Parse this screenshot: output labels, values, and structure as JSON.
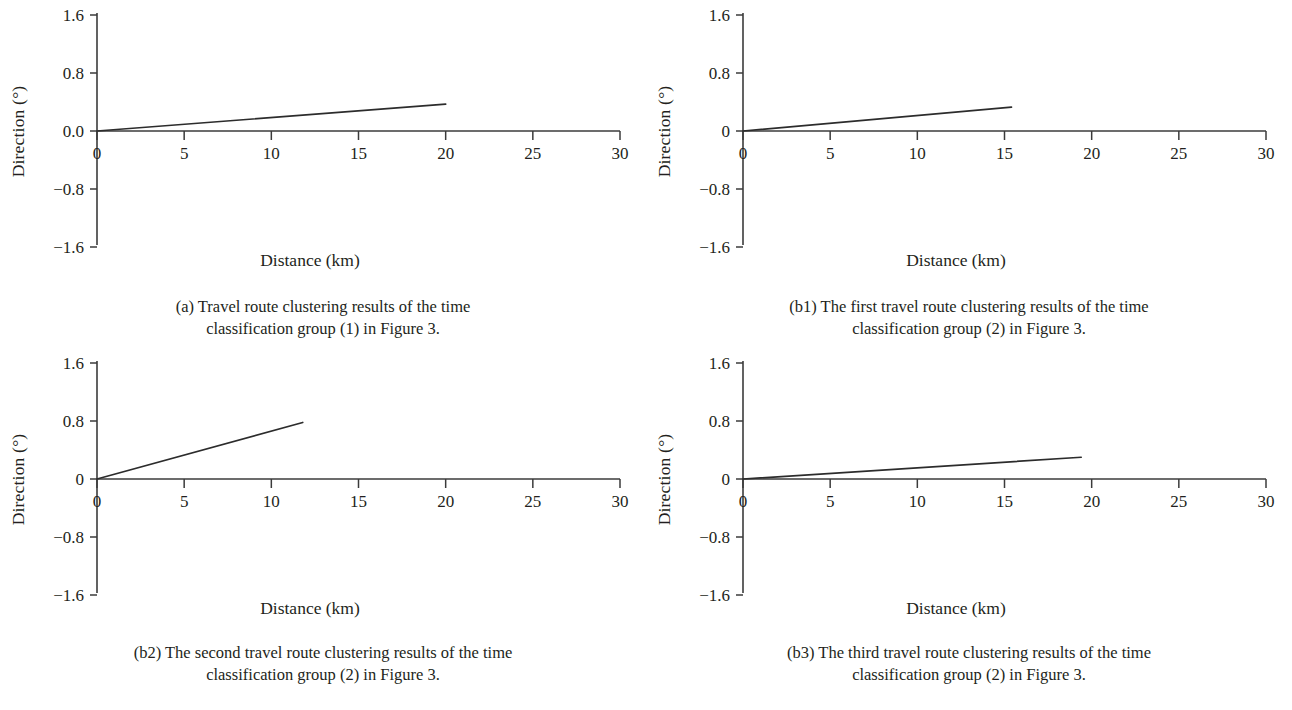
{
  "figure": {
    "background_color": "#ffffff",
    "line_color": "#2c2c2c",
    "axis_color": "#3b3b3b"
  },
  "panels": [
    {
      "id": "a",
      "xlabel": "Distance (km)",
      "ylabel": "Direction (°)",
      "xticks": [
        "0",
        "5",
        "10",
        "15",
        "20",
        "25",
        "30"
      ],
      "yticks": [
        "1.6",
        "0.8",
        "0.0",
        "−0.8",
        "−1.6"
      ],
      "caption_line1": "(a) Travel route clustering results of the time",
      "caption_line2": "classification group (1) in Figure 3."
    },
    {
      "id": "b1",
      "xlabel": "Distance (km)",
      "ylabel": "Direction (°)",
      "xticks": [
        "0",
        "5",
        "10",
        "15",
        "20",
        "25",
        "30"
      ],
      "yticks": [
        "1.6",
        "0.8",
        "0",
        "−0.8",
        "−1.6"
      ],
      "caption_line1": "(b1) The first travel route clustering results of the time",
      "caption_line2": "classification group (2) in Figure 3."
    },
    {
      "id": "b2",
      "xlabel": "Distance (km)",
      "ylabel": "Direction (°)",
      "xticks": [
        "0",
        "5",
        "10",
        "15",
        "20",
        "25",
        "30"
      ],
      "yticks": [
        "1.6",
        "0.8",
        "0",
        "−0.8",
        "−1.6"
      ],
      "caption_line1": "(b2) The second travel route clustering results of the time",
      "caption_line2": "classification group (2) in Figure 3."
    },
    {
      "id": "b3",
      "xlabel": "Distance (km)",
      "ylabel": "Direction (°)",
      "xticks": [
        "0",
        "5",
        "10",
        "15",
        "20",
        "25",
        "30"
      ],
      "yticks": [
        "1.6",
        "0.8",
        "0",
        "−0.8",
        "−1.6"
      ],
      "caption_line1": "(b3) The third travel route clustering results of the time",
      "caption_line2": "classification group (2) in Figure 3."
    }
  ],
  "chart_data": [
    {
      "type": "line",
      "panel": "a",
      "title": "(a) Travel route clustering results of the time classification group (1) in Figure 3.",
      "xlabel": "Distance (km)",
      "ylabel": "Direction (°)",
      "xlim": [
        0,
        30
      ],
      "ylim": [
        -1.6,
        1.6
      ],
      "xticks": [
        0,
        5,
        10,
        15,
        20,
        25,
        30
      ],
      "yticks": [
        -1.6,
        -0.8,
        0.0,
        0.8,
        1.6
      ],
      "ytick_labels": [
        "−1.6",
        "−0.8",
        "0.0",
        "0.8",
        "1.6"
      ],
      "grid": false,
      "legend": null,
      "series": [
        {
          "name": "cluster centroid route",
          "x": [
            0,
            20.0
          ],
          "y": [
            0.0,
            0.37
          ]
        }
      ]
    },
    {
      "type": "line",
      "panel": "b1",
      "title": "(b1) The first travel route clustering results of the time classification group (2) in Figure 3.",
      "xlabel": "Distance (km)",
      "ylabel": "Direction (°)",
      "xlim": [
        0,
        30
      ],
      "ylim": [
        -1.6,
        1.6
      ],
      "xticks": [
        0,
        5,
        10,
        15,
        20,
        25,
        30
      ],
      "yticks": [
        -1.6,
        -0.8,
        0,
        0.8,
        1.6
      ],
      "ytick_labels": [
        "−1.6",
        "−0.8",
        "0",
        "0.8",
        "1.6"
      ],
      "grid": false,
      "legend": null,
      "series": [
        {
          "name": "cluster centroid route",
          "x": [
            0,
            15.4
          ],
          "y": [
            0.0,
            0.33
          ]
        }
      ]
    },
    {
      "type": "line",
      "panel": "b2",
      "title": "(b2) The second travel route clustering results of the time classification group (2) in Figure 3.",
      "xlabel": "Distance (km)",
      "ylabel": "Direction (°)",
      "xlim": [
        0,
        30
      ],
      "ylim": [
        -1.6,
        1.6
      ],
      "xticks": [
        0,
        5,
        10,
        15,
        20,
        25,
        30
      ],
      "yticks": [
        -1.6,
        -0.8,
        0,
        0.8,
        1.6
      ],
      "ytick_labels": [
        "−1.6",
        "−0.8",
        "0",
        "0.8",
        "1.6"
      ],
      "grid": false,
      "legend": null,
      "series": [
        {
          "name": "cluster centroid route",
          "x": [
            0,
            11.8
          ],
          "y": [
            0.0,
            0.78
          ]
        }
      ]
    },
    {
      "type": "line",
      "panel": "b3",
      "title": "(b3) The third travel route clustering results of the time classification group (2) in Figure 3.",
      "xlabel": "Distance (km)",
      "ylabel": "Direction (°)",
      "xlim": [
        0,
        30
      ],
      "ylim": [
        -1.6,
        1.6
      ],
      "xticks": [
        0,
        5,
        10,
        15,
        20,
        25,
        30
      ],
      "yticks": [
        -1.6,
        -0.8,
        0,
        0.8,
        1.6
      ],
      "ytick_labels": [
        "−1.6",
        "−0.8",
        "0",
        "0.8",
        "1.6"
      ],
      "grid": false,
      "legend": null,
      "series": [
        {
          "name": "cluster centroid route",
          "x": [
            0,
            19.4
          ],
          "y": [
            0.0,
            0.3
          ]
        }
      ]
    }
  ]
}
